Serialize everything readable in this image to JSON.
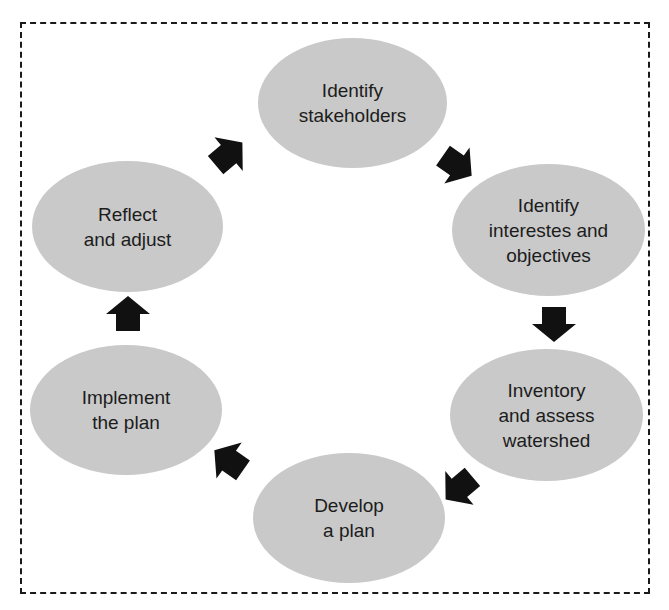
{
  "diagram": {
    "type": "cycle",
    "colors": {
      "node_fill": "#c9c9c9",
      "arrow": "#111111",
      "border": "#1a1a1a",
      "text": "#1c1c1c"
    },
    "nodes": [
      {
        "id": "identify-stakeholders",
        "lines": [
          "Identify",
          "stakeholders"
        ]
      },
      {
        "id": "identify-interests",
        "lines": [
          "Identify",
          "interestes and",
          "objectives"
        ]
      },
      {
        "id": "inventory-assess",
        "lines": [
          "Inventory",
          "and assess",
          "watershed"
        ]
      },
      {
        "id": "develop-plan",
        "lines": [
          "Develop",
          "a plan"
        ]
      },
      {
        "id": "implement-plan",
        "lines": [
          "Implement",
          "the plan"
        ]
      },
      {
        "id": "reflect-adjust",
        "lines": [
          "Reflect",
          "and adjust"
        ]
      }
    ],
    "edges": [
      {
        "from": "identify-stakeholders",
        "to": "identify-interests"
      },
      {
        "from": "identify-interests",
        "to": "inventory-assess"
      },
      {
        "from": "inventory-assess",
        "to": "develop-plan"
      },
      {
        "from": "develop-plan",
        "to": "implement-plan"
      },
      {
        "from": "implement-plan",
        "to": "reflect-adjust"
      },
      {
        "from": "reflect-adjust",
        "to": "identify-stakeholders"
      }
    ]
  }
}
